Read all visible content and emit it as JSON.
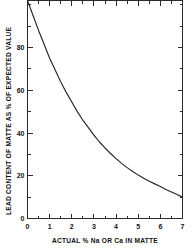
{
  "chart_data": {
    "type": "line",
    "title": "",
    "xlabel": "ACTUAL % Na OR Ca IN MATTE",
    "ylabel": "LEAD CONTENT OF MATTE AS % OF EXPECTED VALUE",
    "xlim": [
      0,
      7
    ],
    "ylim": [
      0,
      102
    ],
    "grid": false,
    "legend": "none",
    "x_ticks_major": [
      0,
      1,
      2,
      3,
      4,
      5,
      6,
      7
    ],
    "x_tick_labels": [
      "0",
      "1",
      "2",
      "3",
      "4",
      "5",
      "6",
      "7"
    ],
    "x_ticks_minor": [
      0.5,
      1.5,
      2.5,
      3.5,
      4.5,
      5.5,
      6.5
    ],
    "y_ticks_major": [
      0,
      20,
      40,
      60,
      80
    ],
    "y_tick_labels": [
      "0",
      "20",
      "40",
      "60",
      "80"
    ],
    "y_ticks_minor": [
      10,
      30,
      50,
      70,
      90,
      100
    ],
    "series": [
      {
        "name": "lead retention",
        "x": [
          0.0,
          0.25,
          0.5,
          0.75,
          1.0,
          1.25,
          1.5,
          1.75,
          2.0,
          2.25,
          2.5,
          2.75,
          3.0,
          3.25,
          3.5,
          3.75,
          4.0,
          4.25,
          4.5,
          4.75,
          5.0,
          5.25,
          5.5,
          5.75,
          6.0,
          6.25,
          6.5,
          6.75,
          7.0
        ],
        "values": [
          102.0,
          95.0,
          88.0,
          81.5,
          75.0,
          69.5,
          64.0,
          59.0,
          54.5,
          50.0,
          46.0,
          42.5,
          39.0,
          35.8,
          33.0,
          30.4,
          28.0,
          25.8,
          23.8,
          22.0,
          20.3,
          18.8,
          17.4,
          16.2,
          15.0,
          13.6,
          12.4,
          11.2,
          10.0
        ]
      }
    ]
  }
}
